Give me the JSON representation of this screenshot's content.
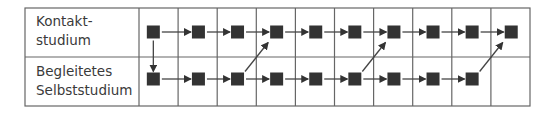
{
  "rows": [
    {
      "label_line1": "Kontakt-",
      "label_line2": "studium"
    },
    {
      "label_line1": "Begleitetes",
      "label_line2": "Selbststudium"
    }
  ],
  "grid": {
    "columns": 10,
    "top_row_steps": 10,
    "bottom_row_steps": 9
  },
  "transitions": [
    {
      "from": "top-1",
      "to": "bottom-1",
      "type": "down"
    },
    {
      "from": "bottom-3",
      "to": "top-4",
      "type": "diagonal-up"
    },
    {
      "from": "bottom-6",
      "to": "top-7",
      "type": "diagonal-up"
    },
    {
      "from": "bottom-9",
      "to": "top-10",
      "type": "diagonal-up"
    }
  ],
  "colors": {
    "node": "#333333",
    "line": "#555555",
    "border": "#666666"
  }
}
